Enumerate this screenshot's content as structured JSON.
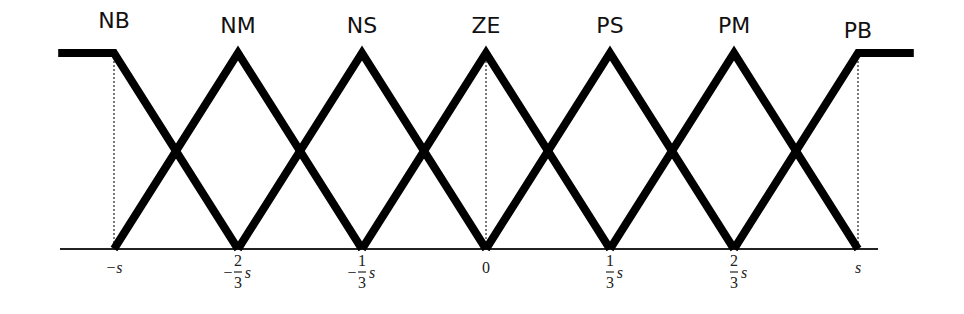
{
  "chart_data": {
    "type": "line",
    "title": "",
    "xlabel": "",
    "ylabel": "",
    "xlim": [
      -1.0,
      1.0
    ],
    "ylim": [
      0,
      1
    ],
    "grid": false,
    "x_unit": "s",
    "ticks": [
      {
        "value": -1.0,
        "sign": "−",
        "num": "",
        "den": "",
        "var": "s"
      },
      {
        "value": -0.6667,
        "sign": "−",
        "num": "2",
        "den": "3",
        "var": "s"
      },
      {
        "value": -0.3333,
        "sign": "−",
        "num": "1",
        "den": "3",
        "var": "s"
      },
      {
        "value": 0.0,
        "sign": "",
        "num": "",
        "den": "",
        "var": "0"
      },
      {
        "value": 0.3333,
        "sign": "",
        "num": "1",
        "den": "3",
        "var": "s"
      },
      {
        "value": 0.6667,
        "sign": "",
        "num": "2",
        "den": "3",
        "var": "s"
      },
      {
        "value": 1.0,
        "sign": "",
        "num": "",
        "den": "",
        "var": "s"
      }
    ],
    "series": [
      {
        "name": "NB",
        "points": [
          [
            -1.15,
            1
          ],
          [
            -1.0,
            1
          ],
          [
            -0.6667,
            0
          ]
        ]
      },
      {
        "name": "NM",
        "points": [
          [
            -1.0,
            0
          ],
          [
            -0.6667,
            1
          ],
          [
            -0.3333,
            0
          ]
        ]
      },
      {
        "name": "NS",
        "points": [
          [
            -0.6667,
            0
          ],
          [
            -0.3333,
            1
          ],
          [
            0.0,
            0
          ]
        ]
      },
      {
        "name": "ZE",
        "points": [
          [
            -0.3333,
            0
          ],
          [
            0.0,
            1
          ],
          [
            0.3333,
            0
          ]
        ]
      },
      {
        "name": "PS",
        "points": [
          [
            0.0,
            0
          ],
          [
            0.3333,
            1
          ],
          [
            0.6667,
            0
          ]
        ]
      },
      {
        "name": "PM",
        "points": [
          [
            0.3333,
            0
          ],
          [
            0.6667,
            1
          ],
          [
            1.0,
            0
          ]
        ]
      },
      {
        "name": "PB",
        "points": [
          [
            0.6667,
            0
          ],
          [
            1.0,
            1
          ],
          [
            1.15,
            1
          ]
        ]
      }
    ],
    "dotted_guides": [
      -1.0,
      0.0,
      1.0
    ]
  }
}
